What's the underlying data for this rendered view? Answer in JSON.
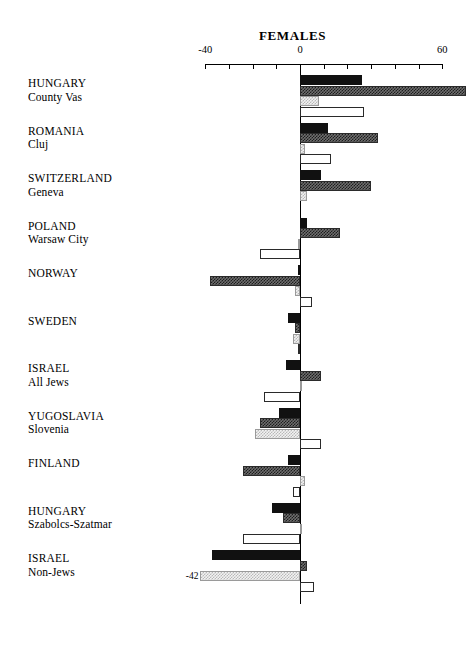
{
  "chart": {
    "title": "FEMALES",
    "axis": {
      "min": -40,
      "max": 60,
      "tick_labels": [
        "-40",
        "0",
        "60"
      ],
      "tick_values": [
        -40,
        -30,
        -20,
        -10,
        0,
        10,
        20,
        30,
        40,
        50,
        60
      ]
    }
  },
  "chart_data": {
    "type": "bar",
    "orientation": "horizontal",
    "title": "FEMALES",
    "xlabel": "",
    "ylabel": "",
    "xlim": [
      -40,
      60
    ],
    "grid": false,
    "legend": "none",
    "bars_per_group": 4,
    "series": [
      {
        "name": "series-1-solid-black",
        "values": [
          26,
          12,
          9,
          3,
          -1,
          -5,
          -6,
          -9,
          -5,
          -12,
          -37
        ]
      },
      {
        "name": "series-2-dark-hatched",
        "values": [
          70,
          33,
          30,
          17,
          -38,
          -2,
          9,
          -17,
          -24,
          -7,
          3
        ]
      },
      {
        "name": "series-3-light-hatched",
        "values": [
          8,
          2,
          3,
          -1,
          -2,
          -3,
          1,
          -19,
          2,
          1,
          -42
        ]
      },
      {
        "name": "series-4-white-outline",
        "values": [
          27,
          13,
          0,
          -17,
          5,
          -1,
          -15,
          9,
          -3,
          -24,
          6
        ]
      }
    ],
    "categories": [
      "HUNGARY County Vas",
      "ROMANIA Cluj",
      "SWITZERLAND Geneva",
      "POLAND Warsaw City",
      "NORWAY",
      "SWEDEN",
      "ISRAEL All Jews",
      "YUGOSLAVIA Slovenia",
      "FINLAND",
      "HUNGARY Szabolcs-Szatmar",
      "ISRAEL Non-Jews"
    ],
    "annotations": [
      {
        "text": "70",
        "series": "series-2-dark-hatched",
        "category": "HUNGARY County Vas"
      },
      {
        "text": "-42",
        "series": "series-3-light-hatched",
        "category": "ISRAEL Non-Jews"
      }
    ]
  },
  "groups": [
    {
      "line1": "HUNGARY",
      "line2": "County Vas",
      "bars": [
        {
          "style": "solid",
          "value": 26,
          "label": ""
        },
        {
          "style": "dark",
          "value": 70,
          "label": "70"
        },
        {
          "style": "light",
          "value": 8,
          "label": ""
        },
        {
          "style": "white",
          "value": 27,
          "label": ""
        }
      ]
    },
    {
      "line1": "ROMANIA",
      "line2": "Cluj",
      "bars": [
        {
          "style": "solid",
          "value": 12,
          "label": ""
        },
        {
          "style": "dark",
          "value": 33,
          "label": ""
        },
        {
          "style": "light",
          "value": 2,
          "label": ""
        },
        {
          "style": "white",
          "value": 13,
          "label": ""
        }
      ]
    },
    {
      "line1": "SWITZERLAND",
      "line2": "Geneva",
      "bars": [
        {
          "style": "solid",
          "value": 9,
          "label": ""
        },
        {
          "style": "dark",
          "value": 30,
          "label": ""
        },
        {
          "style": "light",
          "value": 3,
          "label": ""
        },
        {
          "style": "white",
          "value": 0,
          "label": ""
        }
      ]
    },
    {
      "line1": "POLAND",
      "line2": "Warsaw City",
      "bars": [
        {
          "style": "solid",
          "value": 3,
          "label": ""
        },
        {
          "style": "dark",
          "value": 17,
          "label": ""
        },
        {
          "style": "light",
          "value": -1,
          "label": ""
        },
        {
          "style": "white",
          "value": -17,
          "label": ""
        }
      ]
    },
    {
      "line1": "NORWAY",
      "line2": "",
      "bars": [
        {
          "style": "solid",
          "value": -1,
          "label": ""
        },
        {
          "style": "dark",
          "value": -38,
          "label": ""
        },
        {
          "style": "light",
          "value": -2,
          "label": ""
        },
        {
          "style": "white",
          "value": 5,
          "label": ""
        }
      ]
    },
    {
      "line1": "SWEDEN",
      "line2": "",
      "bars": [
        {
          "style": "solid",
          "value": -5,
          "label": ""
        },
        {
          "style": "dark",
          "value": -2,
          "label": ""
        },
        {
          "style": "light",
          "value": -3,
          "label": ""
        },
        {
          "style": "white",
          "value": -1,
          "label": ""
        }
      ]
    },
    {
      "line1": "ISRAEL",
      "line2": "All Jews",
      "bars": [
        {
          "style": "solid",
          "value": -6,
          "label": ""
        },
        {
          "style": "dark",
          "value": 9,
          "label": ""
        },
        {
          "style": "light",
          "value": 1,
          "label": ""
        },
        {
          "style": "white",
          "value": -15,
          "label": ""
        }
      ]
    },
    {
      "line1": "YUGOSLAVIA",
      "line2": "Slovenia",
      "bars": [
        {
          "style": "solid",
          "value": -9,
          "label": ""
        },
        {
          "style": "dark",
          "value": -17,
          "label": ""
        },
        {
          "style": "light",
          "value": -19,
          "label": ""
        },
        {
          "style": "white",
          "value": 9,
          "label": ""
        }
      ]
    },
    {
      "line1": "FINLAND",
      "line2": "",
      "bars": [
        {
          "style": "solid",
          "value": -5,
          "label": ""
        },
        {
          "style": "dark",
          "value": -24,
          "label": ""
        },
        {
          "style": "light",
          "value": 2,
          "label": ""
        },
        {
          "style": "white",
          "value": -3,
          "label": ""
        }
      ]
    },
    {
      "line1": "HUNGARY",
      "line2": "Szabolcs-Szatmar",
      "bars": [
        {
          "style": "solid",
          "value": -12,
          "label": ""
        },
        {
          "style": "dark",
          "value": -7,
          "label": ""
        },
        {
          "style": "light",
          "value": 1,
          "label": ""
        },
        {
          "style": "white",
          "value": -24,
          "label": ""
        }
      ]
    },
    {
      "line1": "ISRAEL",
      "line2": "Non-Jews",
      "bars": [
        {
          "style": "solid",
          "value": -37,
          "label": ""
        },
        {
          "style": "dark",
          "value": 3,
          "label": ""
        },
        {
          "style": "light",
          "value": -42,
          "label": "-42"
        },
        {
          "style": "white",
          "value": 6,
          "label": ""
        }
      ]
    }
  ]
}
